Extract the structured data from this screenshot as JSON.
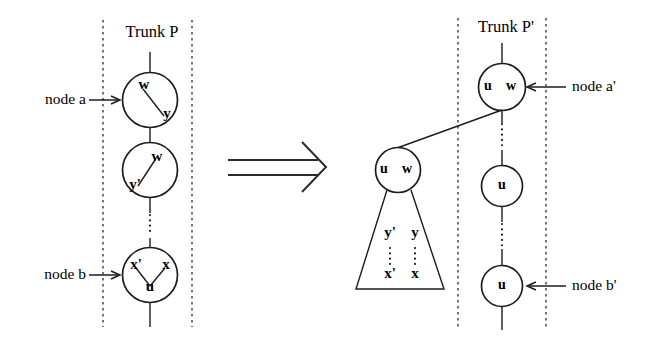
{
  "diagram": {
    "left_panel": {
      "trunk_label": "Trunk P",
      "annotations": [
        {
          "id": "node-a",
          "label": "node a"
        },
        {
          "id": "node-b",
          "label": "node b"
        }
      ],
      "nodes": [
        {
          "id": "left-node-1",
          "symbols": [
            "w",
            "y"
          ]
        },
        {
          "id": "left-node-2",
          "symbols": [
            "w",
            "y'"
          ]
        },
        {
          "id": "left-node-3",
          "symbols": [
            "x'",
            "x",
            "u"
          ]
        }
      ],
      "ellipsis": "vertical-dots"
    },
    "transform_arrow": {
      "glyph": "double-right-arrow"
    },
    "right_panel": {
      "trunk_label": "Trunk P'",
      "annotations": [
        {
          "id": "node-a-prime",
          "label": "node a'"
        },
        {
          "id": "node-b-prime",
          "label": "node b'"
        }
      ],
      "trunk_nodes": [
        {
          "id": "right-node-a-prime",
          "symbols": [
            "u",
            "w"
          ]
        },
        {
          "id": "right-node-mid",
          "symbols": [
            "u"
          ]
        },
        {
          "id": "right-node-b-prime",
          "symbols": [
            "u"
          ]
        }
      ],
      "detached_subtree": {
        "id": "detached-node",
        "symbols": [
          "u",
          "w"
        ],
        "triangle_labels": {
          "left_top": "y'",
          "right_top": "y",
          "left_bottom": "x'",
          "right_bottom": "x"
        }
      }
    },
    "colors": {
      "ink": "#1d1d1d",
      "background": "#ffffff",
      "guide": "#2a2a2a"
    }
  }
}
